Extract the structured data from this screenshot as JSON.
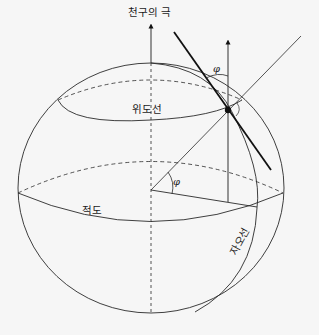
{
  "diagram": {
    "title": "천구의 극",
    "labels": {
      "celestial_pole": "천구의 극",
      "latitude_line": "위도선",
      "equator": "적도",
      "meridian": "자오선"
    },
    "angles": {
      "latitude_at_center": "φ",
      "latitude_at_observer": "φ"
    },
    "colors": {
      "background": "#f6f6f6",
      "stroke": "#2a2a2a",
      "point": "#111111"
    }
  }
}
